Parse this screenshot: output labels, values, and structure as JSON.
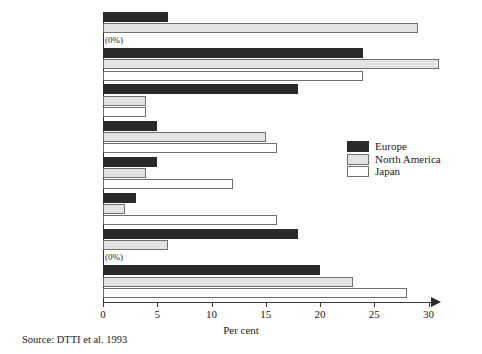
{
  "chart_data": {
    "type": "bar",
    "orientation": "horizontal",
    "title": "",
    "xlabel": "Per cent",
    "ylabel": "",
    "xlim": [
      0,
      32
    ],
    "xticks": [
      0,
      5,
      10,
      15,
      20,
      25,
      30
    ],
    "grid": false,
    "legend_position": "middle-right",
    "categories": [
      "Other",
      "Duty to\nenvironment",
      "Future legal\nrequirements",
      "Shareholder\npressure",
      "Campaigner\npressure",
      "Customer\npressure",
      "Competitive\nadvantage",
      "Public\nrelations"
    ],
    "series": [
      {
        "name": "Europe",
        "color": "#2a2a2a",
        "values": [
          6,
          24,
          18,
          5,
          5,
          3,
          18,
          20
        ]
      },
      {
        "name": "North America",
        "color": "#e3e3e3",
        "values": [
          29,
          31,
          4,
          15,
          4,
          2,
          6,
          23
        ]
      },
      {
        "name": "Japan",
        "color": "#ffffff",
        "values": [
          0,
          24,
          4,
          16,
          12,
          16,
          0,
          28
        ]
      }
    ],
    "annotations": [
      {
        "text": "(0%)",
        "category": "Other",
        "series": "Japan"
      },
      {
        "text": "(0%)",
        "category": "Competitive advantage",
        "series": "Japan"
      }
    ],
    "source": "Source: DTTI et al. 1993"
  },
  "axis": {
    "xlabel": "Per cent",
    "tick_labels": [
      "0",
      "5",
      "10",
      "15",
      "20",
      "25",
      "30"
    ]
  },
  "legend": {
    "entries": [
      {
        "label": "Europe"
      },
      {
        "label": "North America"
      },
      {
        "label": "Japan"
      }
    ]
  },
  "footer": {
    "source": "Source: DTTI et al. 1993"
  }
}
